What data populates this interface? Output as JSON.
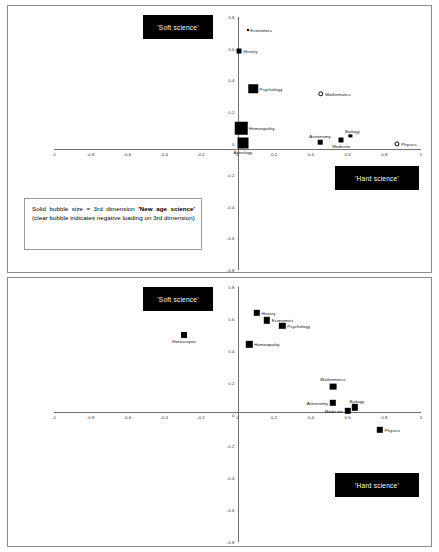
{
  "figure": {
    "legend_note_parts": {
      "p1": "Solid bubble size = 3rd dimension ",
      "p2": "'New age science'",
      "p3": " (clear bubble indicates negative loading on 3rd dimension)"
    },
    "callouts": {
      "soft": "'Soft science'",
      "hard": "'Hard science'"
    }
  },
  "chart_data": [
    {
      "type": "scatter",
      "title": "",
      "xlabel": "",
      "ylabel": "",
      "xlim": [
        -1,
        1
      ],
      "ylim": [
        -0.8,
        0.8
      ],
      "grid": false,
      "legend_position": "none",
      "xticks": [
        "-1",
        "-0.8",
        "-0.6",
        "-0.4",
        "-0.2",
        "0",
        "0.2",
        "0.4",
        "0.6",
        "0.8",
        "1"
      ],
      "xtick_values": [
        -1,
        -0.8,
        -0.6,
        -0.4,
        -0.2,
        0,
        0.2,
        0.4,
        0.6,
        0.8,
        1
      ],
      "yticks": [
        "0.8",
        "0.6",
        "0.4",
        "0.2",
        "0",
        "-0.2",
        "-0.4",
        "-0.6",
        "-0.8"
      ],
      "ytick_values": [
        0.8,
        0.6,
        0.4,
        0.2,
        0,
        -0.2,
        -0.4,
        -0.6,
        -0.8
      ],
      "annotations": [
        "'Soft science'",
        "'Hard science'"
      ],
      "points": [
        {
          "label": "Economics",
          "x": 0.055,
          "y": 0.715,
          "size": 2.0,
          "style": "solid",
          "lab": "r"
        },
        {
          "label": "History",
          "x": 0.01,
          "y": 0.585,
          "size": 5.0,
          "style": "solid",
          "lab": "r"
        },
        {
          "label": "Psychology",
          "x": 0.085,
          "y": 0.345,
          "size": 9.5,
          "style": "solid",
          "lab": "r"
        },
        {
          "label": "Mathematics",
          "x": 0.455,
          "y": 0.315,
          "size": 5.4,
          "style": "hollow",
          "lab": "r"
        },
        {
          "label": "Homeopathy",
          "x": 0.02,
          "y": 0.095,
          "size": 12.5,
          "style": "solid",
          "lab": "r"
        },
        {
          "label": "Astrology",
          "x": 0.03,
          "y": 0.005,
          "size": 11.0,
          "style": "solid",
          "lab": "b"
        },
        {
          "label": "Astronomy",
          "x": 0.45,
          "y": 0.01,
          "size": 4.6,
          "style": "solid",
          "lab": "at"
        },
        {
          "label": "Medicine",
          "x": 0.565,
          "y": 0.02,
          "size": 5.0,
          "style": "solid",
          "lab": "b"
        },
        {
          "label": "Biology",
          "x": 0.615,
          "y": 0.048,
          "size": 3.2,
          "style": "solid",
          "lab": "bt"
        },
        {
          "label": "Physics",
          "x": 0.87,
          "y": -0.005,
          "size": 5.2,
          "style": "hollow",
          "lab": "r"
        }
      ]
    },
    {
      "type": "scatter",
      "title": "",
      "xlabel": "",
      "ylabel": "",
      "xlim": [
        -1,
        1
      ],
      "ylim": [
        -0.8,
        0.8
      ],
      "grid": false,
      "legend_position": "none",
      "xticks": [
        "-1",
        "-0.8",
        "-0.6",
        "-0.4",
        "-0.2",
        "0",
        "0.2",
        "0.4",
        "0.6",
        "0.8",
        "1"
      ],
      "xtick_values": [
        -1,
        -0.8,
        -0.6,
        -0.4,
        -0.2,
        0,
        0.2,
        0.4,
        0.6,
        0.8,
        1
      ],
      "yticks": [
        "0.8",
        "0.6",
        "0.4",
        "0.2",
        "0",
        "-0.2",
        "-0.4",
        "-0.6",
        "-0.8"
      ],
      "ytick_values": [
        0.8,
        0.6,
        0.4,
        0.2,
        0,
        -0.2,
        -0.4,
        -0.6,
        -0.8
      ],
      "annotations": [
        "'Soft science'",
        "'Hard science'"
      ],
      "points": [
        {
          "label": "Horoscopes",
          "x": -0.29,
          "y": 0.5,
          "size": 6.0,
          "style": "solid",
          "lab": "b"
        },
        {
          "label": "History",
          "x": 0.105,
          "y": 0.64,
          "size": 6.4,
          "style": "solid",
          "lab": "r"
        },
        {
          "label": "Economics",
          "x": 0.16,
          "y": 0.59,
          "size": 6.4,
          "style": "solid",
          "lab": "r"
        },
        {
          "label": "Psychology",
          "x": 0.245,
          "y": 0.555,
          "size": 6.4,
          "style": "solid",
          "lab": "r"
        },
        {
          "label": "Homeopathy",
          "x": 0.065,
          "y": 0.44,
          "size": 6.4,
          "style": "solid",
          "lab": "r"
        },
        {
          "label": "Mathematics",
          "x": 0.52,
          "y": 0.175,
          "size": 6.8,
          "style": "solid",
          "lab": "at"
        },
        {
          "label": "Astronomy",
          "x": 0.52,
          "y": 0.075,
          "size": 6.4,
          "style": "solid",
          "lab": "l"
        },
        {
          "label": "Medicine",
          "x": 0.6,
          "y": 0.022,
          "size": 6.4,
          "style": "solid",
          "lab": "l"
        },
        {
          "label": "Biology",
          "x": 0.64,
          "y": 0.045,
          "size": 6.4,
          "style": "solid",
          "lab": "bt"
        },
        {
          "label": "Physics",
          "x": 0.775,
          "y": -0.095,
          "size": 6.4,
          "style": "solid",
          "lab": "r"
        }
      ]
    }
  ]
}
